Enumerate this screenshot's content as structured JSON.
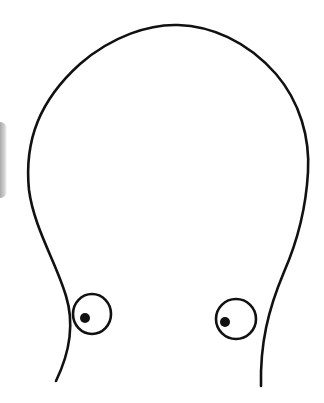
{
  "drawing": {
    "subject": "cartoon-head-outline-with-eyes",
    "stroke_color": "#111111",
    "background_color": "#ffffff",
    "edge_shadow_color": "#9a9a9a",
    "stroke_width": 2.6,
    "head_outline_path": "M 56 381 C 70 352, 74 322, 66 296 C 56 262, 34 228, 29 190 C 24 140, 40 100, 80 64 C 112 36, 150 24, 178 25 C 210 26, 246 40, 276 74 C 300 102, 310 138, 308 172 C 306 208, 298 240, 284 272 C 268 310, 260 344, 261 386",
    "eyes": [
      {
        "name": "left",
        "cx": 92,
        "cy": 314,
        "rx": 19,
        "ry": 20,
        "pupil_cx": 85,
        "pupil_cy": 318,
        "pupil_r": 5
      },
      {
        "name": "right",
        "cx": 236,
        "cy": 319,
        "rx": 20,
        "ry": 20,
        "pupil_cx": 225,
        "pupil_cy": 322,
        "pupil_r": 5
      }
    ]
  }
}
